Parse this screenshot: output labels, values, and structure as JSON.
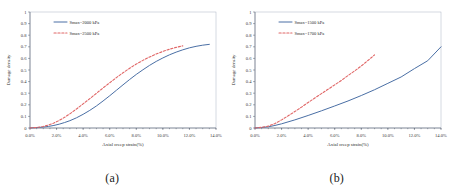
{
  "figure": {
    "panels": [
      {
        "caption": "(a)",
        "legend": [
          {
            "label": "Smax=2000 kPa",
            "style": "solid",
            "color": "#4a6fa5"
          },
          {
            "label": "Smax=2500 kPa",
            "style": "dashed",
            "color": "#e06666"
          }
        ]
      },
      {
        "caption": "(b)",
        "legend": [
          {
            "label": "Smax=1500 kPa",
            "style": "solid",
            "color": "#4a6fa5"
          },
          {
            "label": "Smax=1700 kPa",
            "style": "dashed",
            "color": "#e06666"
          }
        ]
      }
    ]
  },
  "chart_data": [
    {
      "type": "line",
      "title": "(a)",
      "xlabel": "Axial creep strain(%)",
      "ylabel": "Damage density",
      "xlim": [
        0,
        14
      ],
      "ylim": [
        0,
        1
      ],
      "xticks": [
        "0.0%",
        "2.0%",
        "4.0%",
        "6.0%",
        "8.0%",
        "10.0%",
        "12.0%",
        "14.0%"
      ],
      "xtick_values": [
        0,
        2,
        4,
        6,
        8,
        10,
        12,
        14
      ],
      "yticks": [
        "0",
        "0.1",
        "0.2",
        "0.3",
        "0.4",
        "0.5",
        "0.6",
        "0.7",
        "0.8",
        "0.9",
        "1"
      ],
      "ytick_values": [
        0,
        0.1,
        0.2,
        0.3,
        0.4,
        0.5,
        0.6,
        0.7,
        0.8,
        0.9,
        1
      ],
      "grid": false,
      "legend_position": "upper-left",
      "series": [
        {
          "name": "Smax=2000 kPa",
          "style": "solid",
          "color": "#4a6fa5",
          "x": [
            0.0,
            0.6,
            1.0,
            1.4,
            1.8,
            2.2,
            2.6,
            3.0,
            3.5,
            4.0,
            4.5,
            5.0,
            5.5,
            6.0,
            6.5,
            7.0,
            7.5,
            8.0,
            8.5,
            9.0,
            9.5,
            10.0,
            10.5,
            11.0,
            11.5,
            12.0,
            12.5,
            13.0,
            13.5
          ],
          "y": [
            0.0,
            0.004,
            0.008,
            0.014,
            0.022,
            0.033,
            0.047,
            0.063,
            0.088,
            0.118,
            0.152,
            0.19,
            0.233,
            0.278,
            0.325,
            0.372,
            0.418,
            0.462,
            0.502,
            0.54,
            0.574,
            0.604,
            0.631,
            0.654,
            0.674,
            0.691,
            0.704,
            0.714,
            0.721
          ]
        },
        {
          "name": "Smax=2500 kPa",
          "style": "dashed",
          "color": "#e06666",
          "x": [
            0.0,
            0.6,
            1.0,
            1.4,
            1.8,
            2.2,
            2.6,
            3.0,
            3.5,
            4.0,
            4.5,
            5.0,
            5.5,
            6.0,
            6.5,
            7.0,
            7.5,
            8.0,
            8.5,
            9.0,
            9.5,
            10.0,
            10.5,
            11.0,
            11.5
          ],
          "y": [
            0.0,
            0.006,
            0.013,
            0.026,
            0.043,
            0.065,
            0.092,
            0.122,
            0.164,
            0.208,
            0.253,
            0.299,
            0.345,
            0.39,
            0.434,
            0.476,
            0.515,
            0.551,
            0.583,
            0.612,
            0.638,
            0.66,
            0.679,
            0.695,
            0.708
          ]
        }
      ]
    },
    {
      "type": "line",
      "title": "(b)",
      "xlabel": "Axial creep strain(%)",
      "ylabel": "Damage density",
      "xlim": [
        0,
        14
      ],
      "ylim": [
        0,
        1
      ],
      "xticks": [
        "0.0%",
        "2.0%",
        "4.0%",
        "6.0%",
        "8.0%",
        "10.0%",
        "12.0%",
        "14.0%"
      ],
      "xtick_values": [
        0,
        2,
        4,
        6,
        8,
        10,
        12,
        14
      ],
      "yticks": [
        "0",
        "0.1",
        "0.2",
        "0.3",
        "0.4",
        "0.5",
        "0.6",
        "0.7",
        "0.8",
        "0.9",
        "1"
      ],
      "ytick_values": [
        0,
        0.1,
        0.2,
        0.3,
        0.4,
        0.5,
        0.6,
        0.7,
        0.8,
        0.9,
        1
      ],
      "grid": false,
      "legend_position": "upper-left",
      "series": [
        {
          "name": "Smax=1500 kPa",
          "style": "solid",
          "color": "#4a6fa5",
          "x": [
            0.0,
            0.5,
            1.0,
            1.5,
            2.0,
            3.0,
            4.0,
            5.0,
            6.0,
            7.0,
            8.0,
            9.0,
            10.0,
            11.0,
            12.0,
            13.0,
            14.0
          ],
          "y": [
            0.0,
            0.004,
            0.01,
            0.022,
            0.036,
            0.07,
            0.108,
            0.148,
            0.19,
            0.233,
            0.28,
            0.33,
            0.385,
            0.44,
            0.512,
            0.58,
            0.7
          ]
        },
        {
          "name": "Smax=1700 kPa",
          "style": "dashed",
          "color": "#e06666",
          "x": [
            0.0,
            0.5,
            1.0,
            1.5,
            2.0,
            2.5,
            3.0,
            3.5,
            4.0,
            4.5,
            5.0,
            5.5,
            6.0,
            6.5,
            7.0,
            7.5,
            8.0,
            8.5,
            9.0
          ],
          "y": [
            0.0,
            0.006,
            0.016,
            0.038,
            0.07,
            0.105,
            0.142,
            0.18,
            0.22,
            0.258,
            0.296,
            0.334,
            0.372,
            0.41,
            0.452,
            0.492,
            0.535,
            0.582,
            0.63
          ]
        }
      ]
    }
  ]
}
